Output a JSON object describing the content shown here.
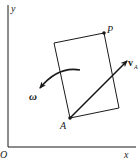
{
  "diagram": {
    "colors": {
      "ink": "#1a1a1a",
      "background": "#ffffff"
    },
    "axes": {
      "origin_label": "O",
      "x_label": "x",
      "y_label": "y"
    },
    "body": {
      "shape": "rectangle",
      "corners": [
        {
          "x": 54,
          "y": 43
        },
        {
          "x": 104,
          "y": 33
        },
        {
          "x": 119,
          "y": 108
        },
        {
          "x": 70,
          "y": 118
        }
      ]
    },
    "points": [
      {
        "id": "P",
        "label": "P",
        "x": 104,
        "y": 33
      },
      {
        "id": "A",
        "label": "A",
        "x": 70,
        "y": 118
      }
    ],
    "vectors": [
      {
        "id": "vA",
        "label_main": "v",
        "label_sub": "A",
        "from": "A",
        "to": {
          "x": 128,
          "y": 60
        }
      }
    ],
    "angular_velocity": {
      "label": "ω",
      "direction": "counterclockwise"
    }
  }
}
